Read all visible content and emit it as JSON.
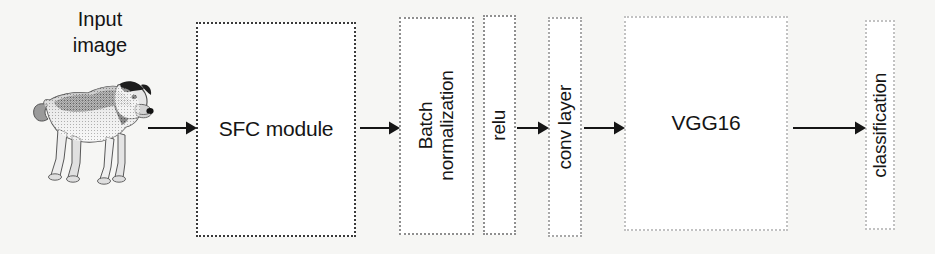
{
  "diagram": {
    "background_color": "#f6f6f4",
    "stroke_color": "#151515",
    "canvas": {
      "width": 935,
      "height": 254
    }
  },
  "input": {
    "caption": "Input\nimage",
    "photo_alt": "photograph of a dog"
  },
  "nodes": [
    {
      "id": "sfc-module",
      "label": "SFC module",
      "orientation": "horizontal",
      "font_size": 21,
      "border_color": "#3a3a3a",
      "x": 196,
      "y": 22,
      "w": 160,
      "h": 215
    },
    {
      "id": "batch-normalization",
      "label": "Batch\nnormalization",
      "orientation": "vertical",
      "font_size": 19,
      "border_color": "#8f8f8f",
      "x": 399,
      "y": 17,
      "w": 75,
      "h": 218
    },
    {
      "id": "relu",
      "label": "relu",
      "orientation": "vertical",
      "font_size": 19,
      "border_color": "#8f8f8f",
      "x": 483,
      "y": 15,
      "w": 33,
      "h": 220
    },
    {
      "id": "conv-layer",
      "label": "conv layer",
      "orientation": "vertical",
      "font_size": 19,
      "border_color": "#a8a8a8",
      "x": 548,
      "y": 17,
      "w": 34,
      "h": 220
    },
    {
      "id": "vgg16",
      "label": "VGG16",
      "orientation": "horizontal",
      "font_size": 21,
      "border_color": "#c2c2c2",
      "x": 624,
      "y": 16,
      "w": 164,
      "h": 215
    },
    {
      "id": "classification",
      "label": "classification",
      "orientation": "vertical",
      "font_size": 19,
      "border_color": "#c2c2c2",
      "x": 865,
      "y": 20,
      "w": 30,
      "h": 210
    }
  ],
  "arrows": [
    {
      "id": "arrow-input-to-sfc",
      "from": "input-image",
      "to": "sfc-module",
      "x": 148,
      "y": 117,
      "w": 49
    },
    {
      "id": "arrow-sfc-to-batchnorm",
      "from": "sfc-module",
      "to": "batch-normalization",
      "x": 360,
      "y": 117,
      "w": 40
    },
    {
      "id": "arrow-relu-to-conv",
      "from": "relu",
      "to": "conv-layer",
      "x": 517,
      "y": 117,
      "w": 32
    },
    {
      "id": "arrow-conv-to-vgg16",
      "from": "conv-layer",
      "to": "vgg16",
      "x": 584,
      "y": 117,
      "w": 41
    },
    {
      "id": "arrow-vgg16-to-classification",
      "from": "vgg16",
      "to": "classification",
      "x": 793,
      "y": 117,
      "w": 73
    }
  ]
}
